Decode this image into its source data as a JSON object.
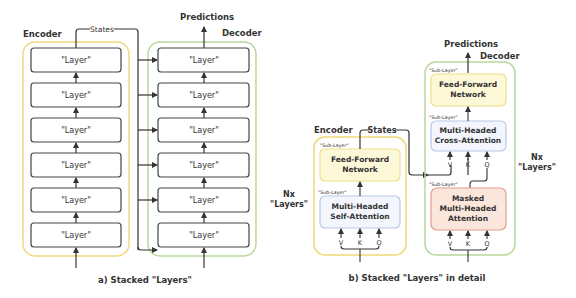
{
  "panel_a": {
    "caption": "a) Stacked \"Layers\"",
    "encoder_label": "Encoder",
    "decoder_label": "Decoder",
    "states_label": "States",
    "predictions_label": "Predictions",
    "encoder_layers": [
      "\"Layer\"",
      "\"Layer\"",
      "\"Layer\"",
      "\"Layer\"",
      "\"Layer\"",
      "\"Layer\""
    ],
    "decoder_layers": [
      "\"Layer\"",
      "\"Layer\"",
      "\"Layer\"",
      "\"Layer\"",
      "\"Layer\"",
      "\"Layer\""
    ]
  },
  "panel_b": {
    "caption": "b) Stacked \"Layers\" in detail",
    "encoder_label": "Encoder",
    "decoder_label": "Decoder",
    "states_label": "States",
    "predictions_label": "Predictions",
    "encoder_repeat": {
      "line1": "Nx",
      "line2": "\"Layers\""
    },
    "decoder_repeat": {
      "line1": "Nx",
      "line2": "\"Layers\""
    },
    "sublayer_tag": "\"Sub-Layer\"",
    "encoder_ffn": {
      "line1": "Feed-Forward",
      "line2": "Network"
    },
    "encoder_attn": {
      "line1": "Multi-Headed",
      "line2": "Self-Attention"
    },
    "decoder_ffn": {
      "line1": "Feed-Forward",
      "line2": "Network"
    },
    "decoder_cross": {
      "line1": "Multi-Headed",
      "line2": "Cross-Attention"
    },
    "decoder_masked": {
      "line1": "Masked",
      "line2": "Multi-Headed",
      "line3": "Attention"
    },
    "inputs": [
      "V",
      "K",
      "Q"
    ]
  },
  "colors": {
    "encoder_border": "#f0d97a",
    "decoder_border": "#b9d99a",
    "ffn_fill": "#fdf8d8",
    "ffn_border": "#ede08a",
    "attn_fill": "#f3f6fc",
    "attn_border": "#b9c8e6",
    "masked_fill": "#fbe6dc",
    "masked_border": "#e0a08a",
    "line": "#333333"
  }
}
